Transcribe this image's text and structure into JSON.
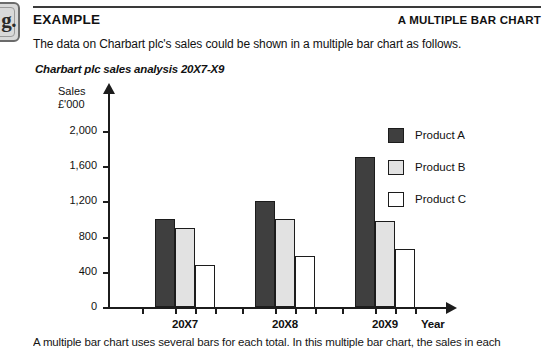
{
  "logo": {
    "text": "g."
  },
  "header": {
    "left_title": "EXAMPLE",
    "right_title": "A MULTIPLE BAR CHART"
  },
  "intro_text": "The data on Charbart plc's sales could be shown in a multiple bar chart as follows.",
  "footer_text": "A multiple bar chart uses several bars for each total. In this multiple bar chart, the sales in each",
  "chart_data": {
    "type": "bar",
    "title": "Charbart plc sales analysis 20X7-X9",
    "ylabel_line1": "Sales",
    "ylabel_line2": "£'000",
    "xlabel": "Year",
    "categories": [
      "20X7",
      "20X8",
      "20X9"
    ],
    "series": [
      {
        "name": "Product A",
        "color": "#3f3f3f",
        "values": [
          1000,
          1200,
          1700
        ]
      },
      {
        "name": "Product B",
        "color": "#e2e2e2",
        "values": [
          900,
          1000,
          980
        ]
      },
      {
        "name": "Product C",
        "color": "#ffffff",
        "values": [
          480,
          580,
          660
        ]
      }
    ],
    "yticks": [
      "0",
      "400",
      "800",
      "1,200",
      "1,600",
      "2,000"
    ],
    "ytick_values": [
      0,
      400,
      800,
      1200,
      1600,
      2000
    ],
    "ylim": [
      0,
      2000
    ],
    "grid": false,
    "legend_position": "right"
  }
}
